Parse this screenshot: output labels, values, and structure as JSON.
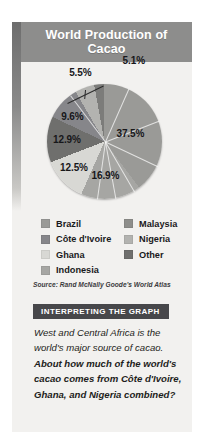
{
  "figure": {
    "title": "World Production of Cacao",
    "source": "Source: Rand McNally Goode's World Atlas"
  },
  "chart_data": {
    "type": "pie",
    "title": "World Production of Cacao",
    "unit": "%",
    "legend_position": "bottom",
    "categories": [
      "Côte d'Ivoire",
      "Ghana",
      "Indonesia",
      "Nigeria",
      "Brazil",
      "Malaysia",
      "Other"
    ],
    "values": [
      37.5,
      16.9,
      12.5,
      12.9,
      9.6,
      5.5,
      5.1
    ],
    "slices": [
      {
        "label": "37.5%",
        "value": 37.5,
        "color": "#9a9a97"
      },
      {
        "label": "16.9%",
        "value": 16.9,
        "color": "#a6a6a3"
      },
      {
        "label": "12.5%",
        "value": 12.5,
        "color": "#d8d8d4"
      },
      {
        "label": "12.9%",
        "value": 12.9,
        "color": "#6f6f6d"
      },
      {
        "label": "9.6%",
        "value": 9.6,
        "color": "#86868a"
      },
      {
        "label": "5.5%",
        "value": 5.5,
        "color": "#b3b3b0"
      },
      {
        "label": "5.1%",
        "value": 5.1,
        "color": "#7c7c7a"
      }
    ]
  },
  "legend": {
    "left": [
      {
        "label": "Brazil",
        "color": "#9a9a97"
      },
      {
        "label": "Côte d'Ivoire",
        "color": "#86868a"
      },
      {
        "label": "Ghana",
        "color": "#d8d8d4"
      },
      {
        "label": "Indonesia",
        "color": "#a6a6a3"
      }
    ],
    "right": [
      {
        "label": "Malaysia",
        "color": "#8e8e8b"
      },
      {
        "label": "Nigeria",
        "color": "#b3b3b0"
      },
      {
        "label": "Other",
        "color": "#6f6f6d"
      }
    ]
  },
  "interpreting": {
    "heading": "INTERPRETING THE GRAPH",
    "statement": "West and Central Africa is the world's major source of cacao.",
    "question": "About how much of the world's cacao comes from Côte d'Ivoire, Ghana, and Nigeria combined?"
  },
  "colors": {
    "panel_background": "#f2f1ef",
    "title_bar": "#8d8d8c",
    "interp_bar": "#47474a",
    "text": "#1d1d20"
  }
}
